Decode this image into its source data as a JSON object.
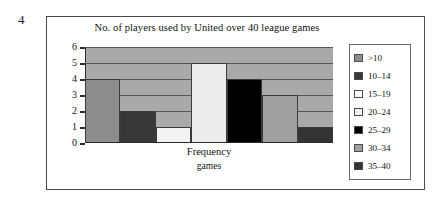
{
  "question_number": "4",
  "chart_data": {
    "type": "bar",
    "title": "No. of players used by United over 40 league games",
    "xlabel": "Frequency",
    "xlabel_sub": "games",
    "ylabel": "Frequency",
    "ylim": [
      0,
      6
    ],
    "yticks": [
      "6",
      "5",
      "4",
      "3",
      "2",
      "1",
      "0"
    ],
    "grid": true,
    "legend_position": "right",
    "categories": [
      ">10",
      "10–14",
      "15–19",
      "20–24",
      "25–29",
      "30–34",
      "35–40"
    ],
    "values": [
      4,
      2,
      1,
      5,
      4,
      3,
      1
    ],
    "colors": [
      "#8d8d8d",
      "#383838",
      "#f2f2f2",
      "#ececec",
      "#000000",
      "#a0a0a0",
      "#333333"
    ],
    "plot_background": "#a9a9a9"
  },
  "legend": {
    "items": [
      {
        "label": ">10",
        "color": "#8d8d8d"
      },
      {
        "label": "10–14",
        "color": "#383838"
      },
      {
        "label": "15–19",
        "color": "#fbfbfb"
      },
      {
        "label": "20–24",
        "color": "#f0f0f0"
      },
      {
        "label": "25–29",
        "color": "#000000"
      },
      {
        "label": "30–34",
        "color": "#a0a0a0"
      },
      {
        "label": "35–40",
        "color": "#333333"
      }
    ]
  }
}
